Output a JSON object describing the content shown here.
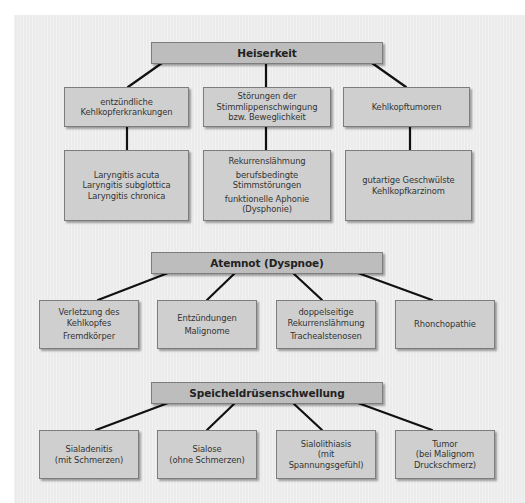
{
  "colors": {
    "panel_background": "#ebebeb",
    "box_fill": "#cfcfcf",
    "title_box_fill": "#bdbdbd",
    "box_border": "#7d7d7d",
    "connector": "#111111",
    "text": "#333333"
  },
  "sections": [
    {
      "title": "Heiserkeit",
      "categories": [
        {
          "label_lines": [
            "entzündliche",
            "Kehlkopferkrankungen"
          ],
          "items": [
            [
              "Laryngitis acuta"
            ],
            [
              "Laryngitis subglottica"
            ],
            [
              "Laryngitis chronica"
            ]
          ]
        },
        {
          "label_lines": [
            "Störungen der",
            "Stimmlippenschwingung",
            "bzw. Beweglichkeit"
          ],
          "items": [
            [
              "Rekurrenslähmung"
            ],
            [
              "berufsbedingte",
              "Stimmstörungen"
            ],
            [
              "funktionelle Aphonie",
              "(Dysphonie)"
            ]
          ]
        },
        {
          "label_lines": [
            "Kehlkopftumoren"
          ],
          "items": [
            [
              "gutartige Geschwülste"
            ],
            [
              "Kehlkopfkarzinom"
            ]
          ]
        }
      ]
    },
    {
      "title": "Atemnot (Dyspnoe)",
      "children": [
        {
          "groups": [
            [
              "Verletzung des",
              "Kehlkopfes"
            ],
            [
              "Fremdkörper"
            ]
          ]
        },
        {
          "groups": [
            [
              "Entzündungen"
            ],
            [
              "Malignome"
            ]
          ]
        },
        {
          "groups": [
            [
              "doppelseitige",
              "Rekurrenslähmung"
            ],
            [
              "Trachealstenosen"
            ]
          ]
        },
        {
          "groups": [
            [
              "Rhonchopathie"
            ]
          ]
        }
      ]
    },
    {
      "title": "Speicheldrüsenschwellung",
      "children": [
        {
          "groups": [
            [
              "Sialadenitis",
              "(mit Schmerzen)"
            ]
          ]
        },
        {
          "groups": [
            [
              "Sialose",
              "(ohne Schmerzen)"
            ]
          ]
        },
        {
          "groups": [
            [
              "Sialolithiasis",
              "(mit",
              "Spannungsgefühl)"
            ]
          ]
        },
        {
          "groups": [
            [
              "Tumor",
              "(bei Malignom",
              "Druckschmerz)"
            ]
          ]
        }
      ]
    }
  ]
}
